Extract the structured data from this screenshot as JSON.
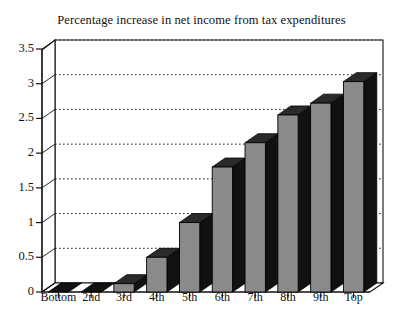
{
  "chart_data": {
    "type": "bar",
    "title": "Percentage increase in net income from tax expenditures",
    "xlabel": "",
    "ylabel": "",
    "categories": [
      "Bottom",
      "2nd",
      "3rd",
      "4th",
      "5th",
      "6th",
      "7th",
      "8th",
      "9th",
      "Top"
    ],
    "values": [
      0.0,
      0.0,
      0.12,
      0.5,
      1.0,
      1.8,
      2.15,
      2.55,
      2.72,
      3.03
    ],
    "ylim": [
      0,
      3.5
    ],
    "ytick_labels": [
      "0",
      "0.5",
      "1",
      "1.5",
      "2",
      "2.5",
      "3",
      "3.5"
    ],
    "ytick_values": [
      0,
      0.5,
      1,
      1.5,
      2,
      2.5,
      3,
      3.5
    ],
    "grid": true,
    "grid_style": "dotted-horizontal",
    "legend": "none",
    "style": "3d-bars",
    "colors": {
      "bar_face": "#8a8a8a",
      "bar_side": "#111111",
      "bar_top": "#2a2a2a",
      "axis": "#111111",
      "grid": "#222222",
      "background": "#ffffff"
    }
  }
}
